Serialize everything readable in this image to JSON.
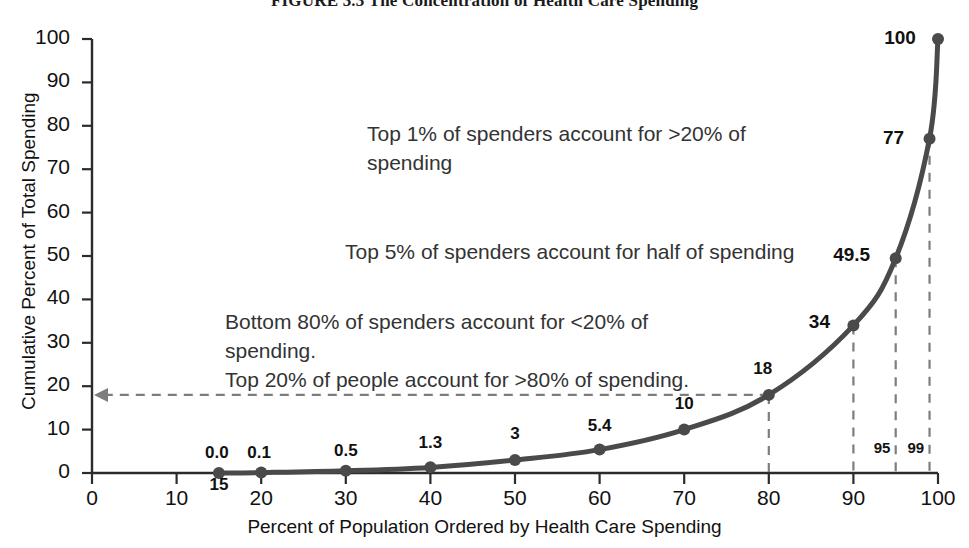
{
  "chart_data": {
    "type": "line",
    "title": "FIGURE 3.3 The Concentration of Health Care Spending",
    "xlabel": "Percent of Population Ordered by Health Care Spending",
    "ylabel": "Cumulative Percent of Total Spending",
    "xlim": [
      0,
      100
    ],
    "ylim": [
      0,
      100
    ],
    "xticks": [
      "0",
      "10",
      "20",
      "30",
      "40",
      "50",
      "60",
      "70",
      "80",
      "90",
      "100"
    ],
    "xtick_values": [
      0,
      10,
      20,
      30,
      40,
      50,
      60,
      70,
      80,
      90,
      100
    ],
    "extra_xticks": [
      {
        "value": 15,
        "label": "15"
      }
    ],
    "yticks": [
      "0",
      "10",
      "20",
      "30",
      "40",
      "50",
      "60",
      "70",
      "80",
      "90",
      "100"
    ],
    "ytick_values": [
      0,
      10,
      20,
      30,
      40,
      50,
      60,
      70,
      80,
      90,
      100
    ],
    "grid": false,
    "legend": "none",
    "series": [
      {
        "name": "Cumulative percent of total spending",
        "x": [
          15,
          20,
          30,
          40,
          50,
          60,
          70,
          80,
          90,
          95,
          99,
          100
        ],
        "values": [
          0.0,
          0.1,
          0.5,
          1.3,
          3,
          5.4,
          10,
          18,
          34,
          49.5,
          77,
          100
        ],
        "point_labels": [
          "0.0",
          "0.1",
          "0.5",
          "1.3",
          "3",
          "5.4",
          "10",
          "18",
          "34",
          "49.5",
          "77",
          "100"
        ],
        "color": "#4a4a4a",
        "marker": "circle"
      }
    ],
    "reference_lines": [
      {
        "type": "vertical",
        "x": 80,
        "label": "",
        "style": "dashed"
      },
      {
        "type": "vertical",
        "x": 90,
        "label": "",
        "style": "dashed"
      },
      {
        "type": "vertical",
        "x": 95,
        "label": "95",
        "style": "dashed"
      },
      {
        "type": "vertical",
        "x": 99,
        "label": "99",
        "style": "dashed"
      },
      {
        "type": "horizontal-arrow",
        "y": 18,
        "from_x": 80,
        "to_x": 0,
        "style": "dashed"
      }
    ],
    "annotations": [
      {
        "id": "top1",
        "lines": [
          "Top 1% of spenders account for >20% of",
          "spending"
        ]
      },
      {
        "id": "top5",
        "lines": [
          "Top 5% of spenders account for half of spending"
        ]
      },
      {
        "id": "bottom80",
        "lines": [
          "Bottom 80% of spenders account for <20% of",
          "spending.",
          "Top 20% of people account for >80% of spending."
        ]
      }
    ]
  },
  "colors": {
    "curve": "#4a4a4a",
    "axis": "#2b2b2b",
    "dashed": "#7d7d7d",
    "text": "#111111",
    "annotation_text": "#333333"
  }
}
